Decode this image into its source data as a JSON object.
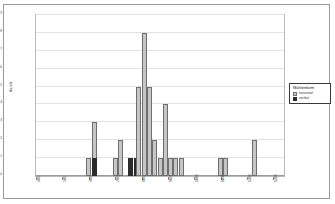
{
  "chart_data": {
    "type": "bar",
    "title": "",
    "xlabel": "",
    "ylabel": "Anzahl",
    "xlim": [
      400,
      1340
    ],
    "ylim": [
      0,
      9
    ],
    "grid": true,
    "legend_position": "right",
    "legend_title": "Mühlenform",
    "y_ticks": [
      "0",
      "1",
      "2",
      "3",
      "4",
      "5",
      "6",
      "7",
      "8",
      "9"
    ],
    "x_ticks": [
      "400",
      "500",
      "600",
      "700",
      "800",
      "900",
      "1000",
      "1100",
      "1200",
      "1300"
    ],
    "series": [
      {
        "name": "horizontal",
        "color": "#c6c6c6"
      },
      {
        "name": "vertikal",
        "color": "#2b2b2b"
      }
    ],
    "bars": [
      {
        "x": 600,
        "horizontal": 1,
        "vertikal": 0
      },
      {
        "x": 620,
        "horizontal": 2,
        "vertikal": 1
      },
      {
        "x": 700,
        "horizontal": 1,
        "vertikal": 0
      },
      {
        "x": 720,
        "horizontal": 2,
        "vertikal": 0
      },
      {
        "x": 760,
        "horizontal": 0,
        "vertikal": 1
      },
      {
        "x": 780,
        "horizontal": 0,
        "vertikal": 1
      },
      {
        "x": 790,
        "horizontal": 5,
        "vertikal": 0
      },
      {
        "x": 810,
        "horizontal": 8,
        "vertikal": 0
      },
      {
        "x": 830,
        "horizontal": 5,
        "vertikal": 0
      },
      {
        "x": 850,
        "horizontal": 2,
        "vertikal": 0
      },
      {
        "x": 870,
        "horizontal": 1,
        "vertikal": 0
      },
      {
        "x": 890,
        "horizontal": 4,
        "vertikal": 0
      },
      {
        "x": 910,
        "horizontal": 1,
        "vertikal": 0
      },
      {
        "x": 930,
        "horizontal": 1,
        "vertikal": 0
      },
      {
        "x": 950,
        "horizontal": 1,
        "vertikal": 0
      },
      {
        "x": 1100,
        "horizontal": 1,
        "vertikal": 0
      },
      {
        "x": 1120,
        "horizontal": 1,
        "vertikal": 0
      },
      {
        "x": 1230,
        "horizontal": 2,
        "vertikal": 0
      }
    ]
  }
}
